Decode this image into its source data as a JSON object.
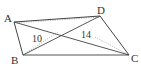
{
  "diagram": {
    "type": "quadrilateral",
    "vertices": {
      "A": {
        "label": "A",
        "x": 14,
        "y": 22
      },
      "B": {
        "label": "B",
        "x": 23,
        "y": 55
      },
      "C": {
        "label": "C",
        "x": 129,
        "y": 55
      },
      "D": {
        "label": "D",
        "x": 100,
        "y": 16
      }
    },
    "segment_labels": {
      "AC_part": "10",
      "BD_part": "14"
    },
    "colors": {
      "stroke": "#444444",
      "dotted": "#aaaaaa",
      "text": "#333333"
    }
  }
}
